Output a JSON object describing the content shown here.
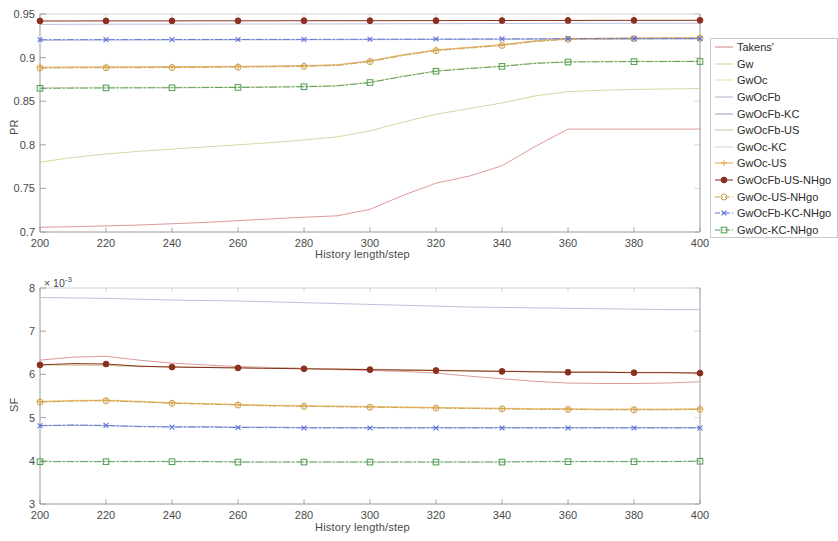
{
  "figure": {
    "background": "#ffffff",
    "axis_color": "#9a9a9a",
    "text_color": "#4a4a4a"
  },
  "legend": {
    "position": "right-outside",
    "border_color": "#c9c9c9",
    "entries": [
      {
        "label": "Takens'",
        "color": "#d98f8f",
        "marker": "none",
        "linestyle": "solid"
      },
      {
        "label": "Gw",
        "color": "#c8d79a",
        "marker": "none",
        "linestyle": "solid"
      },
      {
        "label": "GwOc",
        "color": "#f0e0a8",
        "marker": "none",
        "linestyle": "solid"
      },
      {
        "label": "GwOcFb",
        "color": "#b9b9d8",
        "marker": "none",
        "linestyle": "solid"
      },
      {
        "label": "GwOcFb-KC",
        "color": "#9aa8c8",
        "marker": "none",
        "linestyle": "solid"
      },
      {
        "label": "GwOcFb-US",
        "color": "#d8c8a8",
        "marker": "none",
        "linestyle": "solid"
      },
      {
        "label": "GwOc-KC",
        "color": "#cfe0cf",
        "marker": "none",
        "linestyle": "solid"
      },
      {
        "label": "GwOc-US",
        "color": "#e8a95c",
        "marker": "plus",
        "linestyle": "solid"
      },
      {
        "label": "GwOcFb-US-NHgo",
        "color": "#8b2f1f",
        "marker": "disc",
        "linestyle": "solid"
      },
      {
        "label": "GwOc-US-NHgo",
        "color": "#c9a24a",
        "marker": "circle",
        "linestyle": "dashdot"
      },
      {
        "label": "GwOcFb-KC-NHgo",
        "color": "#5b6fd8",
        "marker": "cross",
        "linestyle": "dashdot"
      },
      {
        "label": "GwOc-KC-NHgo",
        "color": "#4d9a4d",
        "marker": "square",
        "linestyle": "dashdot"
      }
    ]
  },
  "chart_data": [
    {
      "type": "line",
      "id": "pr-panel",
      "title": "",
      "xlabel": "History length/step",
      "ylabel": "PR",
      "xlim": [
        200,
        400
      ],
      "ylim": [
        0.7,
        0.95
      ],
      "xticks": [
        200,
        220,
        240,
        260,
        280,
        300,
        320,
        340,
        360,
        380,
        400
      ],
      "yticks": [
        0.7,
        0.75,
        0.8,
        0.85,
        0.9,
        0.95
      ],
      "ytick_labels": [
        "0.7",
        "0.75",
        "0.8",
        "0.85",
        "0.9",
        "0.95"
      ],
      "grid": false,
      "x": [
        200,
        210,
        220,
        230,
        240,
        250,
        260,
        270,
        280,
        290,
        300,
        310,
        320,
        330,
        340,
        350,
        360,
        370,
        380,
        390,
        400
      ],
      "series": [
        {
          "name": "Takens'",
          "color": "#d98f8f",
          "marker": "none",
          "linestyle": "solid",
          "linewidth": 0.9,
          "values": [
            0.7055,
            0.706,
            0.707,
            0.708,
            0.7095,
            0.711,
            0.713,
            0.715,
            0.717,
            0.7185,
            0.726,
            0.742,
            0.756,
            0.764,
            0.776,
            0.798,
            0.818,
            0.818,
            0.818,
            0.818,
            0.818
          ]
        },
        {
          "name": "Gw",
          "color": "#c8d79a",
          "marker": "none",
          "linestyle": "solid",
          "linewidth": 0.9,
          "values": [
            0.78,
            0.7855,
            0.7895,
            0.7925,
            0.795,
            0.7975,
            0.8,
            0.8025,
            0.8055,
            0.809,
            0.816,
            0.826,
            0.835,
            0.8415,
            0.848,
            0.856,
            0.861,
            0.8625,
            0.8635,
            0.864,
            0.8645
          ]
        },
        {
          "name": "GwOc",
          "color": "#f0e0a8",
          "marker": "none",
          "linestyle": "solid",
          "linewidth": 0.9,
          "values": [
            0.8655,
            0.8658,
            0.866,
            0.866,
            0.866,
            0.8662,
            0.8665,
            0.8668,
            0.8672,
            0.868,
            0.872,
            0.879,
            0.885,
            0.888,
            0.8905,
            0.894,
            0.8955,
            0.8958,
            0.896,
            0.896,
            0.896
          ]
        },
        {
          "name": "GwOcFb",
          "color": "#b9b9d8",
          "marker": "none",
          "linestyle": "solid",
          "linewidth": 0.9,
          "values": [
            0.938,
            0.9382,
            0.9383,
            0.9383,
            0.9384,
            0.9384,
            0.9385,
            0.9385,
            0.9386,
            0.9386,
            0.9387,
            0.9388,
            0.9389,
            0.939,
            0.9391,
            0.9392,
            0.9393,
            0.9393,
            0.9394,
            0.9394,
            0.9394
          ]
        },
        {
          "name": "GwOcFb-KC",
          "color": "#9aa8c8",
          "marker": "none",
          "linestyle": "solid",
          "linewidth": 0.9,
          "values": [
            0.92,
            0.9201,
            0.9202,
            0.9202,
            0.9203,
            0.9203,
            0.9204,
            0.9204,
            0.9205,
            0.9205,
            0.9206,
            0.9207,
            0.9208,
            0.9209,
            0.921,
            0.9211,
            0.9212,
            0.9212,
            0.9213,
            0.9213,
            0.9213
          ]
        },
        {
          "name": "GwOcFb-US",
          "color": "#d8c8a8",
          "marker": "none",
          "linestyle": "solid",
          "linewidth": 0.9,
          "values": [
            0.8885,
            0.8888,
            0.889,
            0.889,
            0.8892,
            0.8894,
            0.8897,
            0.89,
            0.8905,
            0.8915,
            0.896,
            0.903,
            0.9085,
            0.9115,
            0.9145,
            0.919,
            0.9215,
            0.922,
            0.9222,
            0.9224,
            0.9225
          ]
        },
        {
          "name": "GwOc-KC",
          "color": "#cfe0cf",
          "marker": "none",
          "linestyle": "solid",
          "linewidth": 0.9,
          "values": [
            0.865,
            0.8652,
            0.8654,
            0.8655,
            0.8656,
            0.8657,
            0.8659,
            0.8662,
            0.8667,
            0.8676,
            0.8715,
            0.8785,
            0.8845,
            0.8875,
            0.89,
            0.8935,
            0.895,
            0.8953,
            0.8955,
            0.8956,
            0.8956
          ]
        },
        {
          "name": "GwOc-US",
          "color": "#e8a95c",
          "marker": "plus",
          "linestyle": "solid",
          "linewidth": 0.9,
          "values": [
            0.889,
            0.8892,
            0.8893,
            0.8894,
            0.8895,
            0.8897,
            0.89,
            0.8903,
            0.8908,
            0.8918,
            0.8963,
            0.9033,
            0.9088,
            0.9118,
            0.9148,
            0.9193,
            0.9218,
            0.9222,
            0.9225,
            0.9227,
            0.9228
          ]
        },
        {
          "name": "GwOcFb-US-NHgo",
          "color": "#8b2f1f",
          "marker": "disc",
          "linestyle": "solid",
          "linewidth": 1.0,
          "values": [
            0.942,
            0.942,
            0.9421,
            0.9421,
            0.9421,
            0.9422,
            0.9422,
            0.9422,
            0.9423,
            0.9423,
            0.9423,
            0.9424,
            0.9424,
            0.9425,
            0.9425,
            0.9426,
            0.9426,
            0.9427,
            0.9427,
            0.9427,
            0.9428
          ]
        },
        {
          "name": "GwOc-US-NHgo",
          "color": "#c9a24a",
          "marker": "circle",
          "linestyle": "dashdot",
          "linewidth": 0.9,
          "values": [
            0.888,
            0.8882,
            0.8884,
            0.8885,
            0.8886,
            0.8888,
            0.8891,
            0.8894,
            0.8899,
            0.8909,
            0.8954,
            0.9024,
            0.9079,
            0.9109,
            0.9139,
            0.9184,
            0.9209,
            0.9214,
            0.9217,
            0.9219,
            0.922
          ]
        },
        {
          "name": "GwOcFb-KC-NHgo",
          "color": "#5b6fd8",
          "marker": "cross",
          "linestyle": "dashdot",
          "linewidth": 0.9,
          "values": [
            0.9205,
            0.9206,
            0.9206,
            0.9207,
            0.9207,
            0.9208,
            0.9208,
            0.9209,
            0.9209,
            0.921,
            0.9211,
            0.9212,
            0.9213,
            0.9214,
            0.9215,
            0.9216,
            0.9217,
            0.9218,
            0.9218,
            0.9219,
            0.9219
          ]
        },
        {
          "name": "GwOc-KC-NHgo",
          "color": "#4d9a4d",
          "marker": "square",
          "linestyle": "dashdot",
          "linewidth": 0.9,
          "values": [
            0.8648,
            0.865,
            0.8652,
            0.8653,
            0.8654,
            0.8656,
            0.8658,
            0.8661,
            0.8666,
            0.8675,
            0.8714,
            0.8784,
            0.8844,
            0.8874,
            0.8899,
            0.8934,
            0.8949,
            0.8952,
            0.8954,
            0.8955,
            0.8955
          ]
        }
      ]
    },
    {
      "type": "line",
      "id": "sf-panel",
      "title": "",
      "xlabel": "History length/step",
      "ylabel": "SF",
      "y_multiplier": "× 10",
      "y_exponent": "-3",
      "xlim": [
        200,
        400
      ],
      "ylim": [
        3,
        8
      ],
      "xticks": [
        200,
        220,
        240,
        260,
        280,
        300,
        320,
        340,
        360,
        380,
        400
      ],
      "yticks": [
        3,
        4,
        5,
        6,
        7,
        8
      ],
      "ytick_labels": [
        "3",
        "4",
        "5",
        "6",
        "7",
        "8"
      ],
      "grid": false,
      "x": [
        200,
        210,
        220,
        230,
        240,
        250,
        260,
        270,
        280,
        290,
        300,
        310,
        320,
        330,
        340,
        350,
        360,
        370,
        380,
        390,
        400
      ],
      "series": [
        {
          "name": "Takens'",
          "color": "#d98f8f",
          "marker": "none",
          "linestyle": "solid",
          "linewidth": 0.9,
          "values": [
            6.33,
            6.4,
            6.42,
            6.33,
            6.26,
            6.22,
            6.18,
            6.16,
            6.14,
            6.11,
            6.09,
            6.07,
            6.03,
            5.96,
            5.9,
            5.84,
            5.8,
            5.79,
            5.79,
            5.8,
            5.83
          ]
        },
        {
          "name": "Gw",
          "color": "#c8d79a",
          "marker": "none",
          "linestyle": "solid",
          "linewidth": 0.9,
          "values": [
            6.22,
            6.21,
            6.2,
            6.18,
            6.17,
            6.16,
            6.15,
            6.14,
            6.13,
            6.12,
            6.11,
            6.1,
            6.09,
            6.08,
            6.07,
            6.06,
            6.05,
            6.05,
            6.04,
            6.04,
            6.03
          ]
        },
        {
          "name": "GwOc",
          "color": "#f0e0a8",
          "marker": "none",
          "linestyle": "solid",
          "linewidth": 0.9,
          "values": [
            5.38,
            5.4,
            5.41,
            5.38,
            5.35,
            5.33,
            5.31,
            5.29,
            5.28,
            5.27,
            5.26,
            5.25,
            5.24,
            5.23,
            5.22,
            5.21,
            5.21,
            5.2,
            5.2,
            5.2,
            5.21
          ]
        },
        {
          "name": "GwOcFb",
          "color": "#b9b9d8",
          "marker": "none",
          "linestyle": "solid",
          "linewidth": 0.9,
          "values": [
            7.78,
            7.77,
            7.76,
            7.74,
            7.72,
            7.71,
            7.7,
            7.68,
            7.66,
            7.64,
            7.62,
            7.6,
            7.58,
            7.56,
            7.55,
            7.54,
            7.53,
            7.52,
            7.51,
            7.5,
            7.5
          ]
        },
        {
          "name": "GwOcFb-KC",
          "color": "#9aa8c8",
          "marker": "none",
          "linestyle": "solid",
          "linewidth": 0.9,
          "values": [
            4.82,
            4.82,
            4.81,
            4.8,
            4.79,
            4.79,
            4.78,
            4.78,
            4.77,
            4.77,
            4.77,
            4.77,
            4.77,
            4.77,
            4.77,
            4.77,
            4.77,
            4.77,
            4.77,
            4.77,
            4.77
          ]
        },
        {
          "name": "GwOcFb-US",
          "color": "#d8c8a8",
          "marker": "none",
          "linestyle": "solid",
          "linewidth": 0.9,
          "values": [
            6.23,
            6.22,
            6.21,
            6.19,
            6.18,
            6.17,
            6.16,
            6.15,
            6.14,
            6.13,
            6.12,
            6.11,
            6.1,
            6.09,
            6.08,
            6.07,
            6.06,
            6.06,
            6.05,
            6.05,
            6.04
          ]
        },
        {
          "name": "GwOc-KC",
          "color": "#cfe0cf",
          "marker": "none",
          "linestyle": "solid",
          "linewidth": 0.9,
          "values": [
            3.99,
            3.99,
            3.99,
            3.99,
            3.99,
            3.99,
            3.98,
            3.98,
            3.98,
            3.98,
            3.98,
            3.98,
            3.98,
            3.98,
            3.98,
            3.99,
            3.99,
            3.99,
            3.99,
            3.99,
            4.0
          ]
        },
        {
          "name": "GwOc-US",
          "color": "#e8a95c",
          "marker": "plus",
          "linestyle": "solid",
          "linewidth": 0.9,
          "values": [
            5.37,
            5.39,
            5.4,
            5.37,
            5.34,
            5.32,
            5.3,
            5.28,
            5.27,
            5.26,
            5.25,
            5.24,
            5.23,
            5.22,
            5.21,
            5.2,
            5.2,
            5.19,
            5.19,
            5.19,
            5.2
          ]
        },
        {
          "name": "GwOcFb-US-NHgo",
          "color": "#8b2f1f",
          "marker": "disc",
          "linestyle": "solid",
          "linewidth": 1.0,
          "values": [
            6.22,
            6.25,
            6.24,
            6.19,
            6.17,
            6.16,
            6.15,
            6.14,
            6.13,
            6.12,
            6.11,
            6.1,
            6.09,
            6.08,
            6.07,
            6.06,
            6.05,
            6.05,
            6.04,
            6.04,
            6.03
          ]
        },
        {
          "name": "GwOc-US-NHgo",
          "color": "#c9a24a",
          "marker": "circle",
          "linestyle": "dashdot",
          "linewidth": 0.9,
          "values": [
            5.36,
            5.38,
            5.39,
            5.36,
            5.33,
            5.31,
            5.29,
            5.27,
            5.26,
            5.25,
            5.24,
            5.23,
            5.22,
            5.21,
            5.2,
            5.19,
            5.19,
            5.18,
            5.18,
            5.18,
            5.19
          ]
        },
        {
          "name": "GwOcFb-KC-NHgo",
          "color": "#5b6fd8",
          "marker": "cross",
          "linestyle": "dashdot",
          "linewidth": 0.9,
          "values": [
            4.81,
            4.83,
            4.82,
            4.79,
            4.78,
            4.78,
            4.77,
            4.77,
            4.76,
            4.76,
            4.76,
            4.76,
            4.76,
            4.76,
            4.76,
            4.76,
            4.76,
            4.76,
            4.76,
            4.76,
            4.76
          ]
        },
        {
          "name": "GwOc-KC-NHgo",
          "color": "#4d9a4d",
          "marker": "square",
          "linestyle": "dashdot",
          "linewidth": 0.9,
          "values": [
            3.98,
            3.98,
            3.98,
            3.98,
            3.98,
            3.98,
            3.97,
            3.97,
            3.97,
            3.97,
            3.97,
            3.97,
            3.97,
            3.97,
            3.97,
            3.98,
            3.98,
            3.98,
            3.98,
            3.98,
            3.99
          ]
        }
      ]
    }
  ]
}
